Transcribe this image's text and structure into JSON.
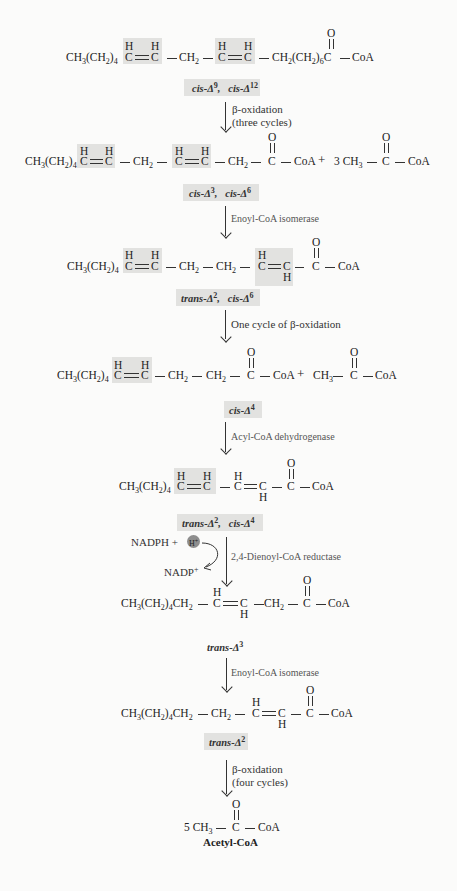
{
  "diagram": {
    "colors": {
      "highlight": "#e2e2e0",
      "h_ion_circle": "#8e8e8e",
      "text": "#222222",
      "enzyme_text": "#555555"
    },
    "steps": [
      {
        "structure": {
          "left": "CH3(CH2)4",
          "groups": [
            "C=C (cis)",
            "CH2",
            "C=C (cis)",
            "CH2(CH2)6C(=O)",
            "CoA"
          ]
        },
        "label_a": "cis-Δ",
        "label_a_sup": "9",
        "label_b": "cis-Δ",
        "label_b_sup": "12"
      },
      {
        "arrow_label_1": "β-oxidation",
        "arrow_label_2": "(three cycles)"
      },
      {
        "structure": {
          "product": "CH3(CH2)4 CH=CH–CH2–CH=CH–CH2–C(=O)–CoA",
          "byproduct": "3 CH3–C(=O)–CoA"
        },
        "label_a": "cis-Δ",
        "label_a_sup": "3",
        "label_b": "cis-Δ",
        "label_b_sup": "6"
      },
      {
        "arrow_label_1": "Enoyl-CoA isomerase"
      },
      {
        "structure": {
          "product": "CH3(CH2)4 CH=CH–CH2–CH2–CH=CH–C(=O)–CoA"
        },
        "label_a": "trans-Δ",
        "label_a_sup": "2",
        "label_b": "cis-Δ",
        "label_b_sup": "6"
      },
      {
        "arrow_label_1": "One cycle of β-oxidation"
      },
      {
        "structure": {
          "product": "CH3(CH2)4 CH=CH–CH2–CH2–C(=O)–CoA",
          "byproduct": "CH3–C(=O)–CoA"
        },
        "label_a": "cis-Δ",
        "label_a_sup": "4"
      },
      {
        "arrow_label_1": "Acyl-CoA dehydrogenase"
      },
      {
        "structure": {
          "product": "CH3(CH2)4 CH=CH–CH=CH–C(=O)–CoA"
        },
        "label_a": "trans-Δ",
        "label_a_sup": "2",
        "label_b": "cis-Δ",
        "label_b_sup": "4"
      },
      {
        "arrow_label_1": "2,4-Dienoyl-CoA reductase",
        "cofactor_in": "NADPH +",
        "cofactor_ion": "H+",
        "cofactor_out": "NADP+"
      },
      {
        "structure": {
          "product": "CH3(CH2)4CH2–CH=CH–CH2–C(=O)–CoA"
        },
        "label_a": "trans-Δ",
        "label_a_sup": "3"
      },
      {
        "arrow_label_1": "Enoyl-CoA isomerase"
      },
      {
        "structure": {
          "product": "CH3(CH2)4CH2–CH2–CH=CH–C(=O)–CoA"
        },
        "label_a": "trans-Δ",
        "label_a_sup": "2"
      },
      {
        "arrow_label_1": "β-oxidation",
        "arrow_label_2": "(four cycles)"
      },
      {
        "structure": {
          "product": "5 CH3–C(=O)–CoA"
        },
        "name": "Acetyl-CoA"
      }
    ],
    "atoms": {
      "H": "H",
      "C": "C",
      "O": "O",
      "CoA": "CoA",
      "CH2": "CH",
      "CH3": "CH",
      "plus": "+",
      "n2": "2",
      "n3": "3",
      "n4": "4",
      "n6": "6",
      "coef3": "3",
      "coef5": "5",
      "ch3ch2_4_a": "CH",
      "ch3ch2_4_b": "(CH",
      "ch3ch2_4_c": ")"
    }
  }
}
